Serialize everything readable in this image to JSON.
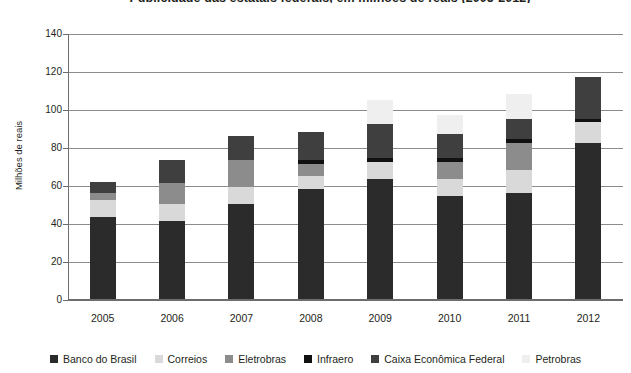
{
  "chart_data": {
    "type": "bar",
    "stacked": true,
    "title": "Publicidade das estatais federais, em milhões de reais (2005-2012)",
    "xlabel": "",
    "ylabel": "Milhões de reais",
    "ylim": [
      0,
      140
    ],
    "yticks": [
      0,
      20,
      40,
      60,
      80,
      100,
      120,
      140
    ],
    "grid": true,
    "legend_position": "bottom",
    "categories": [
      "2005",
      "2006",
      "2007",
      "2008",
      "2009",
      "2010",
      "2011",
      "2012"
    ],
    "series": [
      {
        "name": "Banco do Brasil",
        "color": "#2b2b2b",
        "values": [
          43,
          41,
          50,
          58,
          63,
          54,
          56,
          82
        ]
      },
      {
        "name": "Correios",
        "color": "#d9d9d9",
        "values": [
          9,
          9,
          9,
          7,
          9,
          9,
          12,
          11
        ]
      },
      {
        "name": "Eletrobras",
        "color": "#8c8c8c",
        "values": [
          4,
          11,
          14,
          6,
          0,
          9,
          14,
          0
        ]
      },
      {
        "name": "Infraero",
        "color": "#111111",
        "values": [
          0,
          0,
          0,
          2,
          2,
          2,
          2,
          2
        ]
      },
      {
        "name": "Caixa Econômica Federal",
        "color": "#3f3f3f",
        "values": [
          5.5,
          12,
          13,
          15,
          18,
          13,
          11,
          22
        ]
      },
      {
        "name": "Petrobras",
        "color": "#efefef",
        "values": [
          0,
          0,
          0,
          0,
          12.5,
          10,
          13,
          0
        ]
      }
    ],
    "totals": [
      61.5,
      73,
      86,
      88,
      104.5,
      97,
      108,
      117
    ]
  },
  "legend": {
    "items": [
      {
        "label": "Banco do Brasil",
        "color": "#2b2b2b"
      },
      {
        "label": "Correios",
        "color": "#d9d9d9"
      },
      {
        "label": "Eletrobras",
        "color": "#8c8c8c"
      },
      {
        "label": "Infraero",
        "color": "#111111"
      },
      {
        "label": "Caixa Econômica Federal",
        "color": "#3f3f3f"
      },
      {
        "label": "Petrobras",
        "color": "#efefef"
      }
    ]
  }
}
